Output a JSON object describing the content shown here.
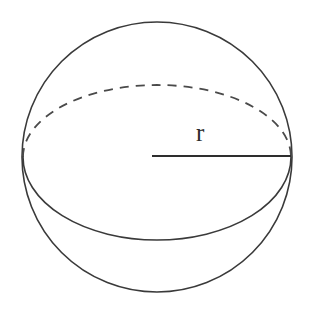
{
  "figure": {
    "background_color": "#ffffff",
    "stroke_color": "#3a3a3a",
    "dashed_stroke_color": "#4a4a4a",
    "radius_stroke_color": "#2e2e2e",
    "label_color": "#2b2b2b"
  },
  "labels": {
    "radius": "r"
  },
  "geometry": {
    "outline_circle": {
      "center_x": 157,
      "center_y": 157,
      "radius": 135
    },
    "equator_ellipse": {
      "center_x": 157,
      "center_y": 157,
      "radius_x": 134,
      "radius_y": 72,
      "back_arc_style": "dashed",
      "front_arc_style": "solid"
    },
    "radius_segment": {
      "start_x": 152,
      "start_y": 156,
      "end_x": 291,
      "end_y": 156
    },
    "radius_label_position": {
      "x": 203,
      "y": 135
    }
  },
  "icons": {
    "sphere": "sphere-icon",
    "radius_arrow": "radius-line-icon"
  }
}
